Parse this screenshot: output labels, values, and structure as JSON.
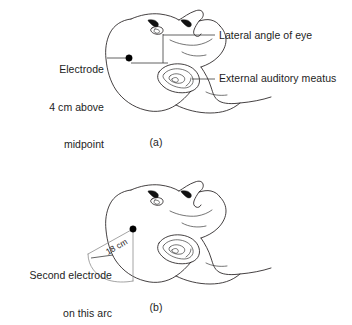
{
  "figure": {
    "domain_kind": "anatomical line diagram",
    "background_color": "#ffffff",
    "ink_color": "#231f20",
    "panels": [
      {
        "id": "a",
        "caption": "(a)",
        "labels": [
          {
            "name": "electrode-above-midpoint",
            "text": "Electrode\n4 cm above\nmidpoint",
            "side": "left"
          },
          {
            "name": "lateral-angle-of-eye",
            "text": "Lateral angle of eye",
            "side": "right"
          },
          {
            "name": "external-auditory-meatus",
            "text": "External auditory meatus",
            "side": "right"
          }
        ]
      },
      {
        "id": "b",
        "caption": "(b)",
        "labels": [
          {
            "name": "second-electrode-on-arc",
            "text": "Second electrode\non this arc",
            "side": "left"
          },
          {
            "name": "arc-radius-dimension",
            "text": "18 cm",
            "side": "inline"
          }
        ]
      }
    ]
  },
  "panel_a": {
    "caption": "(a)",
    "label_electrode_line1": "Electrode",
    "label_electrode_line2": "4 cm above",
    "label_electrode_line3": "midpoint",
    "label_lateral_angle": "Lateral angle of eye",
    "label_meatus": "External auditory meatus"
  },
  "panel_b": {
    "caption": "(b)",
    "label_second_electrode_line1": "Second electrode",
    "label_second_electrode_line2": "on this arc",
    "dimension_label": "18 cm"
  }
}
